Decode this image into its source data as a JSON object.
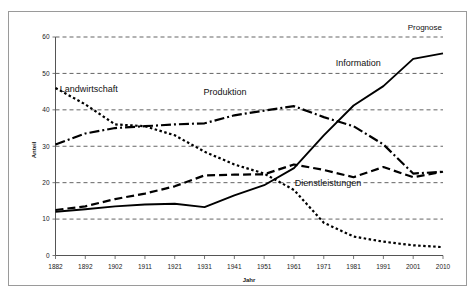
{
  "figure": {
    "annotation_top_right": "Prognose",
    "border_color": "#9a9a9a",
    "background": "#ffffff"
  },
  "chart_data": {
    "type": "line",
    "title": "",
    "subtitle": "",
    "xlabel": "Jahr",
    "ylabel": "Anteil",
    "xlim": [
      1882,
      2010
    ],
    "ylim": [
      0,
      60
    ],
    "yticks": [
      0,
      10,
      20,
      30,
      40,
      50,
      60
    ],
    "ytick_labels": [
      "0",
      "10",
      "20",
      "30",
      "40",
      "50",
      "60"
    ],
    "xticks": [
      1882,
      1892,
      1902,
      1911,
      1921,
      1931,
      1941,
      1951,
      1961,
      1971,
      1981,
      1991,
      2001,
      2010
    ],
    "xtick_labels": [
      "1882",
      "1892",
      "1902",
      "1911",
      "1921",
      "1931",
      "1941",
      "1951",
      "1961",
      "1971",
      "1981",
      "1991",
      "2001",
      "2010"
    ],
    "grid": true,
    "grid_axis": "y",
    "legend": "inline-annotations",
    "annotations": [
      {
        "text": "Prognose",
        "x": 2004,
        "y": 62
      },
      {
        "text": "Landwirtschaft",
        "x": 1893,
        "y": 45
      },
      {
        "text": "Produktion",
        "x": 1938,
        "y": 44
      },
      {
        "text": "Information",
        "x": 1982,
        "y": 52
      },
      {
        "text": "Dienstleistungen",
        "x": 1972,
        "y": 19
      }
    ],
    "x": [
      1882,
      1892,
      1902,
      1911,
      1921,
      1931,
      1941,
      1951,
      1961,
      1971,
      1981,
      1991,
      2001,
      2010
    ],
    "series": [
      {
        "name": "Landwirtschaft",
        "style": "dotted",
        "values": [
          46.0,
          41.5,
          36.0,
          35.5,
          33.0,
          28.5,
          25.0,
          22.5,
          18.0,
          9.0,
          5.2,
          3.8,
          2.8,
          2.3
        ]
      },
      {
        "name": "Produktion",
        "style": "dash-dot",
        "values": [
          30.5,
          33.5,
          35.0,
          35.5,
          36.0,
          36.3,
          38.5,
          39.8,
          41.0,
          38.0,
          35.5,
          30.5,
          22.5,
          23.0
        ]
      },
      {
        "name": "Dienstleistungen",
        "style": "dashed",
        "values": [
          12.5,
          13.5,
          15.5,
          17.0,
          19.0,
          22.0,
          22.2,
          22.3,
          25.0,
          23.5,
          21.5,
          24.3,
          21.5,
          23.0
        ]
      },
      {
        "name": "Information",
        "style": "solid",
        "values": [
          12.0,
          12.7,
          13.5,
          14.0,
          14.2,
          13.3,
          16.5,
          19.3,
          24.0,
          33.0,
          41.2,
          46.5,
          54.0,
          55.5
        ]
      }
    ]
  }
}
